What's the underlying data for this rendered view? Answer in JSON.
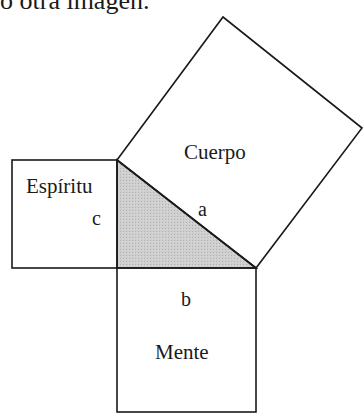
{
  "header": {
    "partial_text": "o otra imagen."
  },
  "diagram": {
    "squares": [
      {
        "id": "hypotenuse",
        "label": "Cuerpo",
        "side_label": "a"
      },
      {
        "id": "leg_vertical",
        "label": "Espíritu",
        "side_label": "c"
      },
      {
        "id": "leg_horizontal",
        "label": "Mente",
        "side_label": "b"
      }
    ],
    "triangle": {
      "fill": "#c8c8c8"
    },
    "colors": {
      "stroke": "#1a1a1a",
      "background": "#ffffff",
      "triangle_fill": "#c8c8c8"
    }
  }
}
